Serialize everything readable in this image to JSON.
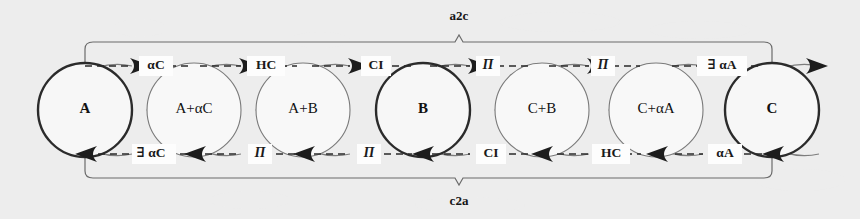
{
  "figure": {
    "type": "state-transition-diagram",
    "background_color": "#fdfdfd",
    "ink_color": "#2a2a2a",
    "accent_color": "#7a7a7a"
  },
  "brackets": {
    "top": {
      "label": "a2c",
      "direction": "left-to-right",
      "from": "A",
      "to": "C"
    },
    "bottom": {
      "label": "c2a",
      "direction": "right-to-left",
      "from": "C",
      "to": "A"
    }
  },
  "nodes": [
    {
      "id": "n0",
      "label": "A",
      "emphasis": "bold",
      "cx": 85,
      "cy": 110,
      "r": 47
    },
    {
      "id": "n1",
      "label": "A+αC",
      "emphasis": "normal",
      "cx": 194,
      "cy": 110,
      "r": 47
    },
    {
      "id": "n2",
      "label": "A+B",
      "emphasis": "normal",
      "cx": 303,
      "cy": 110,
      "r": 47
    },
    {
      "id": "n3",
      "label": "B",
      "emphasis": "bold",
      "cx": 423,
      "cy": 110,
      "r": 47
    },
    {
      "id": "n4",
      "label": "C+B",
      "emphasis": "normal",
      "cx": 542,
      "cy": 110,
      "r": 47
    },
    {
      "id": "n5",
      "label": "C+αA",
      "emphasis": "normal",
      "cx": 656,
      "cy": 110,
      "r": 47
    },
    {
      "id": "n6",
      "label": "C",
      "emphasis": "bold",
      "cx": 772,
      "cy": 110,
      "r": 47
    }
  ],
  "forward_edges": [
    {
      "from": "A",
      "to": "A+αC",
      "label": "αC",
      "style": "plain"
    },
    {
      "from": "A+αC",
      "to": "A+B",
      "label": "HC",
      "style": "plain"
    },
    {
      "from": "A+B",
      "to": "B",
      "label": "CI",
      "style": "plain"
    },
    {
      "from": "B",
      "to": "C+B",
      "label": "Π",
      "style": "pi"
    },
    {
      "from": "C+B",
      "to": "C+αA",
      "label": "Π",
      "style": "pi"
    },
    {
      "from": "C+αA",
      "to": "C",
      "label": "∃ αA",
      "style": "plain"
    }
  ],
  "backward_edges": [
    {
      "from": "C",
      "to": "C+αA",
      "label": "αA",
      "style": "plain"
    },
    {
      "from": "C+αA",
      "to": "C+B",
      "label": "HC",
      "style": "plain"
    },
    {
      "from": "C+B",
      "to": "B",
      "label": "CI",
      "style": "plain"
    },
    {
      "from": "B",
      "to": "A+B",
      "label": "Π",
      "style": "pi"
    },
    {
      "from": "A+B",
      "to": "A+αC",
      "label": "Π",
      "style": "pi"
    },
    {
      "from": "A+αC",
      "to": "A",
      "label": "∃ αC",
      "style": "plain"
    }
  ],
  "node_labels": {
    "n0": "A",
    "n1": "A+αC",
    "n2": "A+B",
    "n3": "B",
    "n4": "C+B",
    "n5": "C+αA",
    "n6": "C"
  },
  "forward_labels": {
    "e0": "αC",
    "e1": "HC",
    "e2": "CI",
    "e3": "Π",
    "e4": "Π",
    "e5": "∃ αA"
  },
  "backward_labels": {
    "e0": "∃ αC",
    "e1": "Π",
    "e2": "Π",
    "e3": "CI",
    "e4": "HC",
    "e5": "αA"
  }
}
